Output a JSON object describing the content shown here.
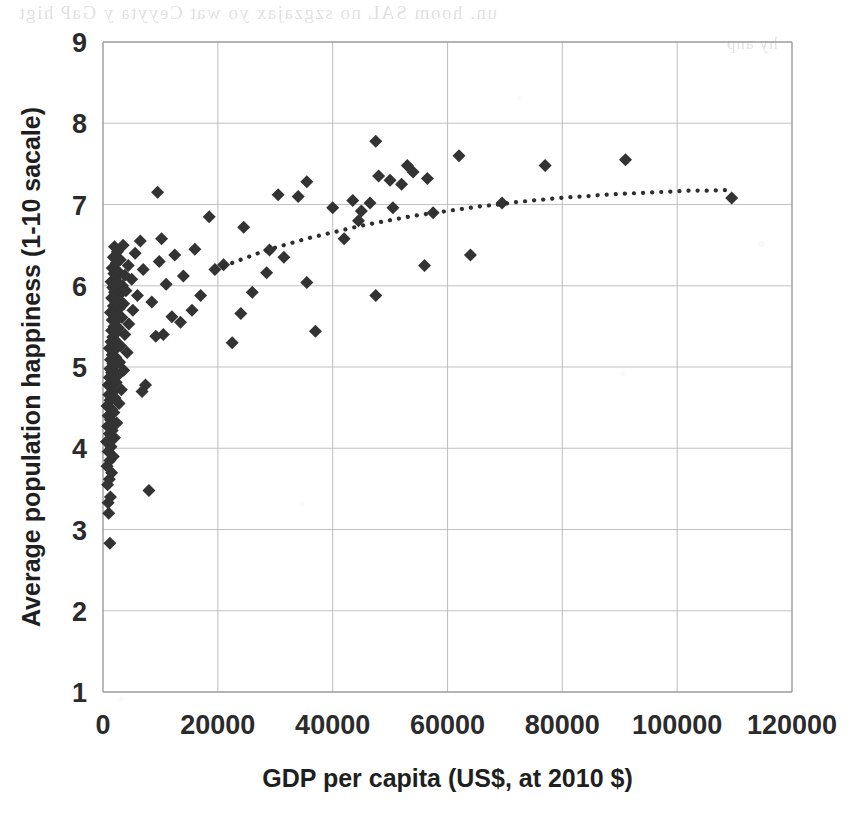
{
  "page": {
    "background_color": "#ffffff",
    "scan_artifact_note": "faint mirrored bleed-through from the reverse of the scanned page",
    "bleed_through_lines": [
      "un. hoom SAL no szgzajax  yo   wat Ceyyta y GaP  higt",
      "hy anp",
      "o o"
    ]
  },
  "chart_data": {
    "type": "scatter",
    "title": "",
    "subtitle": "",
    "xlabel": "GDP per capita (US$, at 2010 $)",
    "ylabel": "Average population happiness (1-10 sacale)",
    "xlim": [
      0,
      120000
    ],
    "ylim": [
      1,
      9
    ],
    "xticks": [
      0,
      20000,
      40000,
      60000,
      80000,
      100000,
      120000
    ],
    "yticks": [
      1,
      2,
      3,
      4,
      5,
      6,
      7,
      8,
      9
    ],
    "xtick_labels": [
      "0",
      "20000",
      "40000",
      "60000",
      "80000",
      "100000",
      "120000"
    ],
    "ytick_labels": [
      "1",
      "2",
      "3",
      "4",
      "5",
      "6",
      "7",
      "8",
      "9"
    ],
    "grid": true,
    "grid_color": "#b9b9b9",
    "legend": null,
    "legend_position": "none",
    "marker": {
      "shape": "diamond",
      "color": "#333333",
      "size_px": 13
    },
    "trendline": {
      "present": true,
      "style": "dotted",
      "color": "#2e2e2e",
      "shape": "logarithmic",
      "x_start": 21000,
      "x_end": 109500,
      "y_start": 6.24,
      "y_end": 7.18,
      "points": [
        [
          21000,
          6.24
        ],
        [
          24000,
          6.32
        ],
        [
          27000,
          6.4
        ],
        [
          30000,
          6.47
        ],
        [
          33000,
          6.53
        ],
        [
          36000,
          6.59
        ],
        [
          39000,
          6.64
        ],
        [
          42000,
          6.69
        ],
        [
          45000,
          6.74
        ],
        [
          48000,
          6.78
        ],
        [
          51000,
          6.82
        ],
        [
          54000,
          6.86
        ],
        [
          57000,
          6.89
        ],
        [
          60000,
          6.92
        ],
        [
          63000,
          6.95
        ],
        [
          66000,
          6.98
        ],
        [
          69000,
          7.0
        ],
        [
          72000,
          7.03
        ],
        [
          75000,
          7.05
        ],
        [
          78000,
          7.07
        ],
        [
          81000,
          7.09
        ],
        [
          84000,
          7.1
        ],
        [
          87000,
          7.12
        ],
        [
          90000,
          7.13
        ],
        [
          93000,
          7.14
        ],
        [
          96000,
          7.15
        ],
        [
          99000,
          7.16
        ],
        [
          102000,
          7.17
        ],
        [
          105000,
          7.17
        ],
        [
          109500,
          7.18
        ]
      ]
    },
    "series": [
      {
        "name": "Countries",
        "marker": "diamond",
        "color": "#333333",
        "points": [
          [
            1200,
            2.83
          ],
          [
            1000,
            3.2
          ],
          [
            900,
            3.33
          ],
          [
            1300,
            3.4
          ],
          [
            8000,
            3.48
          ],
          [
            800,
            3.55
          ],
          [
            1100,
            3.62
          ],
          [
            1500,
            3.7
          ],
          [
            700,
            3.78
          ],
          [
            1200,
            3.85
          ],
          [
            1800,
            3.9
          ],
          [
            900,
            3.96
          ],
          [
            1400,
            4.02
          ],
          [
            600,
            4.08
          ],
          [
            2000,
            4.13
          ],
          [
            1100,
            4.18
          ],
          [
            1600,
            4.22
          ],
          [
            800,
            4.27
          ],
          [
            2400,
            4.31
          ],
          [
            1300,
            4.35
          ],
          [
            900,
            4.4
          ],
          [
            1900,
            4.44
          ],
          [
            1500,
            4.48
          ],
          [
            700,
            4.52
          ],
          [
            2800,
            4.55
          ],
          [
            1200,
            4.59
          ],
          [
            2100,
            4.62
          ],
          [
            1000,
            4.66
          ],
          [
            1700,
            4.69
          ],
          [
            3200,
            4.72
          ],
          [
            1400,
            4.75
          ],
          [
            900,
            4.78
          ],
          [
            2300,
            4.81
          ],
          [
            1800,
            4.84
          ],
          [
            1100,
            4.87
          ],
          [
            6800,
            4.7
          ],
          [
            2600,
            4.9
          ],
          [
            1500,
            4.93
          ],
          [
            3600,
            4.96
          ],
          [
            1200,
            4.98
          ],
          [
            2000,
            5.01
          ],
          [
            7400,
            4.78
          ],
          [
            1700,
            5.04
          ],
          [
            2900,
            5.06
          ],
          [
            1300,
            5.09
          ],
          [
            2200,
            5.12
          ],
          [
            1600,
            5.15
          ],
          [
            4200,
            5.18
          ],
          [
            1900,
            5.2
          ],
          [
            1100,
            5.23
          ],
          [
            3100,
            5.26
          ],
          [
            2500,
            5.28
          ],
          [
            1400,
            5.31
          ],
          [
            22500,
            5.3
          ],
          [
            2000,
            5.34
          ],
          [
            1700,
            5.37
          ],
          [
            3800,
            5.4
          ],
          [
            2300,
            5.42
          ],
          [
            9200,
            5.38
          ],
          [
            1500,
            5.45
          ],
          [
            2700,
            5.48
          ],
          [
            10500,
            5.4
          ],
          [
            1900,
            5.5
          ],
          [
            4500,
            5.53
          ],
          [
            2100,
            5.56
          ],
          [
            37000,
            5.44
          ],
          [
            1600,
            5.58
          ],
          [
            3300,
            5.61
          ],
          [
            2400,
            5.64
          ],
          [
            24000,
            5.66
          ],
          [
            1300,
            5.67
          ],
          [
            5200,
            5.7
          ],
          [
            2800,
            5.72
          ],
          [
            13500,
            5.55
          ],
          [
            1800,
            5.75
          ],
          [
            3600,
            5.78
          ],
          [
            2200,
            5.8
          ],
          [
            12000,
            5.62
          ],
          [
            15500,
            5.7
          ],
          [
            2600,
            5.83
          ],
          [
            1500,
            5.85
          ],
          [
            6000,
            5.88
          ],
          [
            3000,
            5.9
          ],
          [
            47500,
            5.88
          ],
          [
            17000,
            5.88
          ],
          [
            2000,
            5.92
          ],
          [
            4000,
            5.94
          ],
          [
            2400,
            5.96
          ],
          [
            26000,
            5.92
          ],
          [
            1700,
            5.98
          ],
          [
            8500,
            5.8
          ],
          [
            3400,
            6.0
          ],
          [
            11000,
            6.02
          ],
          [
            2800,
            6.03
          ],
          [
            19500,
            6.2
          ],
          [
            1400,
            6.05
          ],
          [
            5000,
            6.08
          ],
          [
            35500,
            6.04
          ],
          [
            2200,
            6.1
          ],
          [
            14000,
            6.12
          ],
          [
            3800,
            6.13
          ],
          [
            1900,
            6.15
          ],
          [
            28500,
            6.16
          ],
          [
            2600,
            6.18
          ],
          [
            7000,
            6.2
          ],
          [
            31500,
            6.35
          ],
          [
            1600,
            6.22
          ],
          [
            4400,
            6.25
          ],
          [
            21000,
            6.26
          ],
          [
            2300,
            6.28
          ],
          [
            9800,
            6.3
          ],
          [
            56000,
            6.25
          ],
          [
            3000,
            6.32
          ],
          [
            1800,
            6.35
          ],
          [
            12500,
            6.38
          ],
          [
            5600,
            6.4
          ],
          [
            64000,
            6.38
          ],
          [
            2500,
            6.42
          ],
          [
            16000,
            6.45
          ],
          [
            2000,
            6.48
          ],
          [
            42000,
            6.58
          ],
          [
            3500,
            6.5
          ],
          [
            10200,
            6.58
          ],
          [
            24500,
            6.72
          ],
          [
            6500,
            6.55
          ],
          [
            29000,
            6.44
          ],
          [
            44500,
            6.8
          ],
          [
            18500,
            6.85
          ],
          [
            43500,
            7.05
          ],
          [
            34000,
            7.1
          ],
          [
            46500,
            7.02
          ],
          [
            52000,
            7.25
          ],
          [
            50000,
            7.3
          ],
          [
            35500,
            7.28
          ],
          [
            48000,
            7.35
          ],
          [
            54000,
            7.4
          ],
          [
            56500,
            7.32
          ],
          [
            53000,
            7.48
          ],
          [
            9500,
            7.15
          ],
          [
            30500,
            7.12
          ],
          [
            47500,
            7.78
          ],
          [
            62000,
            7.6
          ],
          [
            77000,
            7.48
          ],
          [
            91000,
            7.55
          ],
          [
            69500,
            7.02
          ],
          [
            109500,
            7.08
          ],
          [
            57500,
            6.9
          ],
          [
            40000,
            6.96
          ],
          [
            45000,
            6.92
          ],
          [
            50500,
            6.96
          ]
        ]
      }
    ]
  }
}
